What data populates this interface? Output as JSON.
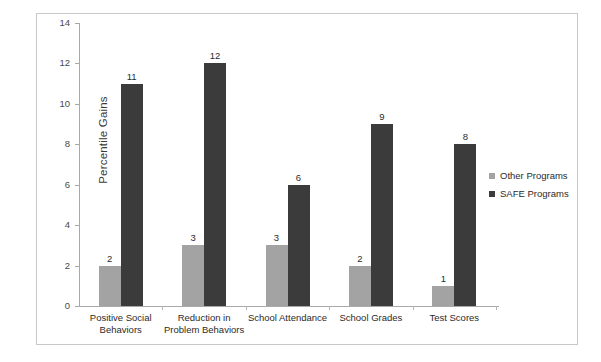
{
  "chart_data": {
    "type": "bar",
    "title": "",
    "xlabel": "",
    "ylabel": "Percentile Gains",
    "ylim": [
      0,
      14
    ],
    "yticks": [
      0,
      2,
      4,
      6,
      8,
      10,
      12,
      14
    ],
    "ytick_labels": [
      "0",
      "2",
      "4",
      "6",
      "8",
      "10",
      "12",
      "14"
    ],
    "grid": false,
    "legend_position": "right-middle",
    "categories": [
      "Positive Social Behaviors",
      "Reduction in Problem Behaviors",
      "School Attendance",
      "School Grades",
      "Test Scores"
    ],
    "category_lines": [
      [
        "Positive Social",
        "Behaviors"
      ],
      [
        "Reduction in",
        "Problem Behaviors"
      ],
      [
        "School Attendance"
      ],
      [
        "School Grades"
      ],
      [
        "Test Scores"
      ]
    ],
    "series": [
      {
        "name": "Other Programs",
        "color": "#a3a3a3",
        "values": [
          2,
          3,
          3,
          2,
          1
        ],
        "value_labels": [
          "2",
          "3",
          "3",
          "2",
          "1"
        ]
      },
      {
        "name": "SAFE Programs",
        "color": "#3b3b3b",
        "values": [
          11,
          12,
          6,
          9,
          8
        ],
        "value_labels": [
          "11",
          "12",
          "6",
          "9",
          "8"
        ]
      }
    ]
  },
  "legend": {
    "items": [
      {
        "label": "Other Programs",
        "color": "#a3a3a3"
      },
      {
        "label": "SAFE Programs",
        "color": "#3b3b3b"
      }
    ]
  },
  "axis": {
    "y_title": "Percentile Gains"
  }
}
